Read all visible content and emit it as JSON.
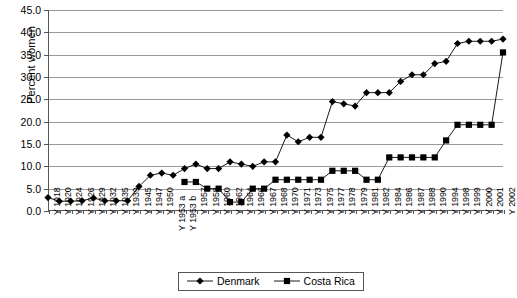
{
  "chart_data": {
    "type": "line",
    "title": "",
    "xlabel": "",
    "ylabel": "Percent women",
    "ylim": [
      0.0,
      45.0
    ],
    "ytick_step": 5.0,
    "ytick_labels": [
      "0.0",
      "5.0",
      "10.0",
      "15.0",
      "20.0",
      "25.0",
      "30.0",
      "35.0",
      "40.0",
      "45.0"
    ],
    "grid": true,
    "legend_position": "bottom-center",
    "categories": [
      "Y 1918",
      "Y 1920",
      "Y 1924",
      "Y 1926",
      "Y 1929",
      "Y 1932",
      "Y 1935",
      "Y 1939",
      "Y 1945",
      "Y 1947",
      "Y 1950",
      "Y 1953 a",
      "Y 1953 b",
      "Y 1957",
      "Y 1958",
      "Y 1960",
      "Y 1962",
      "Y 1964",
      "Y 1966",
      "Y 1967",
      "Y 1968",
      "Y 1970",
      "Y 1971",
      "Y 1973",
      "Y 1975",
      "Y 1977",
      "Y 1978",
      "Y 1979",
      "Y 1981",
      "Y 1982",
      "Y 1984",
      "Y 1986",
      "Y 1987",
      "Y 1988",
      "Y 1990",
      "Y 1994",
      "Y 1998",
      "Y 1999",
      "Y 2000",
      "Y 2001",
      "Y 2002"
    ],
    "series": [
      {
        "name": "Denmark",
        "marker": "diamond",
        "color": "#000000",
        "values": [
          3.0,
          2.2,
          2.2,
          2.3,
          2.9,
          2.3,
          2.3,
          2.3,
          5.5,
          8.0,
          8.5,
          8.0,
          9.5,
          10.5,
          9.5,
          9.5,
          11.0,
          10.5,
          10.0,
          11.0,
          11.0,
          17.0,
          15.5,
          16.5,
          16.5,
          24.5,
          24.0,
          23.5,
          26.5,
          26.5,
          26.5,
          29.0,
          30.5,
          30.5,
          33.0,
          33.5,
          37.5,
          38.0,
          38.0,
          38.0,
          38.5
        ]
      },
      {
        "name": "Costa Rica",
        "marker": "square",
        "color": "#000000",
        "values": [
          null,
          null,
          null,
          null,
          null,
          null,
          null,
          null,
          null,
          null,
          null,
          null,
          6.5,
          6.5,
          5.0,
          5.0,
          2.0,
          2.0,
          5.0,
          5.0,
          7.0,
          7.0,
          7.0,
          7.0,
          7.0,
          9.0,
          9.0,
          9.0,
          7.0,
          7.0,
          12.0,
          12.0,
          12.0,
          12.0,
          12.0,
          15.8,
          19.3,
          19.3,
          19.3,
          19.3,
          35.5
        ]
      }
    ]
  },
  "legend": {
    "entries": [
      {
        "label": "Denmark",
        "marker": "diamond-marker"
      },
      {
        "label": "Costa Rica",
        "marker": "square-marker"
      }
    ]
  }
}
